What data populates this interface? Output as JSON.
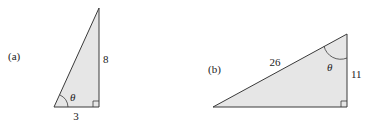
{
  "figures": [
    {
      "id": "a",
      "label": "(a)",
      "sides": {
        "vertical": "8",
        "horizontal": "3"
      },
      "angle_label": "θ",
      "angle_location": "bottom-left vertex",
      "right_angle": "bottom-right"
    },
    {
      "id": "b",
      "label": "(b)",
      "sides": {
        "hypotenuse": "26",
        "vertical": "11"
      },
      "angle_label": "θ",
      "angle_location": "top vertex",
      "right_angle": "bottom-right"
    }
  ],
  "colors": {
    "fill": "#e6e6e6",
    "stroke": "#3a3a3a",
    "text": "#222222"
  }
}
